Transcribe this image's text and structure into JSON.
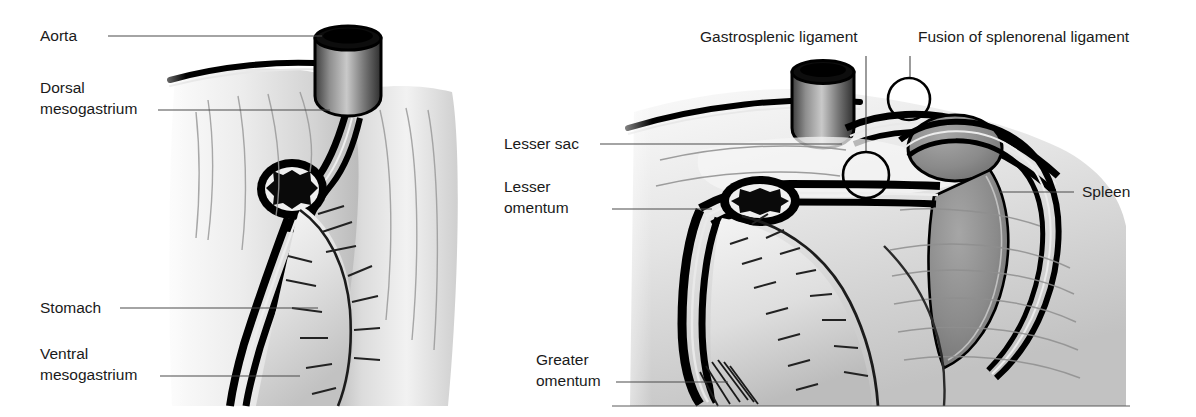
{
  "figure": {
    "background_color": "#ffffff",
    "label_color": "#1a1a1a",
    "leader_line_color": "#4a4a4a",
    "outline_color": "#000000",
    "spleen_fill": "#8a8a8a",
    "tissue_light": "#f2f2f2",
    "tissue_mid": "#d8d8d8",
    "tissue_dark": "#a8a8a8"
  },
  "panels": [
    {
      "id": "left-panel",
      "name": "early-embryonic-stage",
      "labels": [
        {
          "id": "aorta",
          "name": "aorta",
          "lines": [
            "Aorta"
          ],
          "text_x": 40,
          "text_y": 41,
          "anchor": "start",
          "leader": "M 108 36 L 322 36"
        },
        {
          "id": "dorsal-mesogastrium",
          "name": "dorsal-mesogastrium",
          "lines": [
            "Dorsal",
            "mesogastrium"
          ],
          "text_x": 40,
          "text_y": 93,
          "anchor": "start",
          "leader": "M 158 110 L 330 110"
        },
        {
          "id": "stomach",
          "name": "stomach",
          "lines": [
            "Stomach"
          ],
          "text_x": 40,
          "text_y": 313,
          "anchor": "start",
          "leader": "M 120 308 L 318 308"
        },
        {
          "id": "ventral-mesogastrium",
          "name": "ventral-mesogastrium",
          "lines": [
            "Ventral",
            "mesogastrium"
          ],
          "text_x": 40,
          "text_y": 359,
          "anchor": "start",
          "leader": "M 160 376 L 300 376"
        }
      ]
    },
    {
      "id": "right-panel",
      "name": "later-stage-with-spleen",
      "labels": [
        {
          "id": "gastrosplenic-ligament",
          "name": "gastrosplenic-ligament",
          "lines": [
            "Gastrosplenic ligament"
          ],
          "text_x": 700,
          "text_y": 42,
          "anchor": "start",
          "leader": "M 866 56 L 866 152"
        },
        {
          "id": "fusion-of-splenorenal-ligament",
          "name": "fusion-of-splenorenal-ligament",
          "lines": [
            "Fusion of splenorenal ligament"
          ],
          "text_x": 918,
          "text_y": 42,
          "anchor": "start",
          "leader": "M 910 56 L 910 78"
        },
        {
          "id": "lesser-sac",
          "name": "lesser-sac",
          "lines": [
            "Lesser sac"
          ],
          "text_x": 504,
          "text_y": 149,
          "anchor": "start",
          "leader": "M 600 144 L 842 144"
        },
        {
          "id": "lesser-omentum",
          "name": "lesser-omentum",
          "lines": [
            "Lesser",
            "omentum"
          ],
          "text_x": 504,
          "text_y": 192,
          "anchor": "start",
          "leader": "M 612 209 L 712 209"
        },
        {
          "id": "spleen",
          "name": "spleen",
          "lines": [
            "Spleen"
          ],
          "text_x": 1082,
          "text_y": 197,
          "anchor": "start",
          "leader": "M 1000 192 L 1074 192"
        },
        {
          "id": "greater-omentum",
          "name": "greater-omentum",
          "lines": [
            "Greater",
            "omentum"
          ],
          "text_x": 536,
          "text_y": 365,
          "anchor": "start",
          "leader": "M 616 382 L 728 382"
        }
      ],
      "markers": [
        {
          "id": "gastrosplenic-marker",
          "name": "gastrosplenic-circle-marker",
          "cx": 866,
          "cy": 175,
          "r": 23
        },
        {
          "id": "splenorenal-marker",
          "name": "splenorenal-circle-marker",
          "cx": 909,
          "cy": 99,
          "r": 21
        }
      ]
    }
  ]
}
